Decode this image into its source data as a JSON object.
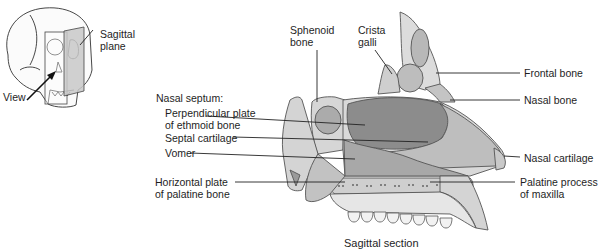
{
  "inset": {
    "plane_label": "Sagittal\nplane",
    "view_label": "View"
  },
  "labels": {
    "sphenoid_bone": "Sphenoid\nbone",
    "crista_galli": "Crista\ngalli",
    "frontal_bone": "Frontal bone",
    "nasal_bone": "Nasal bone",
    "nasal_septum_heading": "Nasal septum:",
    "perpendicular_plate": "Perpendicular plate\nof ethmoid bone",
    "septal_cartilage": "Septal cartilage",
    "vomer": "Vomer",
    "nasal_cartilage": "Nasal cartilage",
    "horizontal_plate": "Horizontal plate\nof palatine bone",
    "palatine_process": "Palatine process\nof maxilla"
  },
  "caption": "Sagittal section",
  "colors": {
    "bone_light": "#d8d8d8",
    "ethmoid_dark": "#8a8a8a",
    "cartilage": "#bdbdbd",
    "vomer": "#a9a9a9",
    "spongy": "#cfcfcf",
    "outline": "#555555",
    "plane": "#c8c8c8"
  }
}
